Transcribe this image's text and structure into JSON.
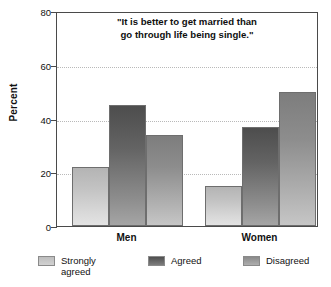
{
  "chart_data": {
    "type": "bar",
    "title": "\"It is better to get married than\ngo through life being single.\"",
    "title_line1": "\"It is better to get married than",
    "title_line2": "go through life being single.\"",
    "xlabel": "",
    "ylabel": "Percent",
    "ylim": [
      0,
      80
    ],
    "yticks": [
      0,
      20,
      40,
      60,
      80
    ],
    "ytick_labels": [
      "0",
      "20",
      "40",
      "60",
      "80"
    ],
    "grid": true,
    "grid_axis": "y",
    "legend_position": "bottom",
    "categories": [
      "Men",
      "Women"
    ],
    "series": [
      {
        "name": "Strongly\nagreed",
        "name_flat": "Strongly agreed",
        "color": "#c8c8c8",
        "values": [
          22,
          15
        ]
      },
      {
        "name": "Agreed",
        "name_flat": "Agreed",
        "color": "#5a5a5a",
        "values": [
          45,
          37
        ]
      },
      {
        "name": "Disagreed",
        "name_flat": "Disagreed",
        "color": "#949494",
        "values": [
          34,
          50
        ]
      }
    ]
  },
  "legend": {
    "items": [
      {
        "label": "Strongly\nagreed",
        "swatch": "legend-swatch-strongly-agreed"
      },
      {
        "label": "Agreed",
        "swatch": "legend-swatch-agreed"
      },
      {
        "label": "Disagreed",
        "swatch": "legend-swatch-disagreed"
      }
    ]
  },
  "colors": {
    "axis": "#4a4a4a",
    "grid": "#b9b9b9",
    "text": "#111111",
    "background": "#ffffff"
  }
}
